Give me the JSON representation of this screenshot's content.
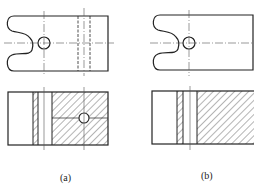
{
  "figure": {
    "panels": [
      {
        "id": "a",
        "label": "(a)"
      },
      {
        "id": "b",
        "label": "(b)"
      }
    ],
    "caption": "",
    "colors": {
      "line": "#222222",
      "centerline": "#555555",
      "hatch": "#444444",
      "background": "#ffffff"
    }
  }
}
